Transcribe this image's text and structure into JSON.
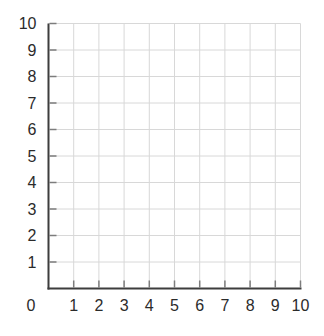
{
  "chart_data": {
    "type": "scatter",
    "title": "",
    "subtitle": "",
    "xlabel": "",
    "ylabel": "",
    "xlim": [
      0,
      10
    ],
    "ylim": [
      0,
      10
    ],
    "xticks": [
      0,
      1,
      2,
      3,
      4,
      5,
      6,
      7,
      8,
      9,
      10
    ],
    "yticks": [
      0,
      1,
      2,
      3,
      4,
      5,
      6,
      7,
      8,
      9,
      10
    ],
    "x_tick_labels": [
      "0",
      "1",
      "2",
      "3",
      "4",
      "5",
      "6",
      "7",
      "8",
      "9",
      "10"
    ],
    "y_tick_labels": [
      "0",
      "1",
      "2",
      "3",
      "4",
      "5",
      "6",
      "7",
      "8",
      "9",
      "10"
    ],
    "origin_label": "0",
    "grid": true,
    "legend": false,
    "series": [],
    "points": [],
    "colors": {
      "background": "#ffffff",
      "axis": "#3d3d3d",
      "tick": "#7d7d7d",
      "grid": "#d8d8d8",
      "label": "#2b2b2b"
    }
  }
}
